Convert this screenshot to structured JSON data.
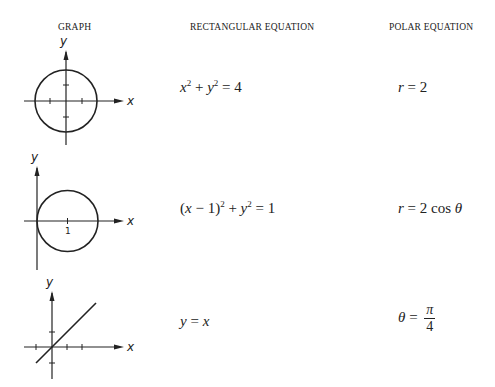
{
  "headers": {
    "graph": "GRAPH",
    "rectangular": "RECTANGULAR EQUATION",
    "polar": "POLAR EQUATION"
  },
  "rows": [
    {
      "graph": {
        "type": "circle-centered-origin",
        "x_label": "x",
        "y_label": "y"
      },
      "rectangular": {
        "text": "x² + y² = 4"
      },
      "polar": {
        "text": "r = 2"
      }
    },
    {
      "graph": {
        "type": "circle-centered-(1,0)",
        "x_label": "x",
        "y_label": "y",
        "tick_label": "1"
      },
      "rectangular": {
        "text": "(x − 1)² + y² = 1"
      },
      "polar": {
        "text": "r = 2 cos θ"
      }
    },
    {
      "graph": {
        "type": "line-y-equals-x",
        "x_label": "x",
        "y_label": "y"
      },
      "rectangular": {
        "text": "y = x"
      },
      "polar": {
        "text": "θ = π/4",
        "numerator": "π",
        "denominator": "4"
      }
    }
  ],
  "labels": {
    "x": "x",
    "y": "y",
    "one": "1",
    "eq": "=",
    "plus": "+",
    "minus": "−",
    "two": "2",
    "four": "4",
    "cos": "cos",
    "theta": "θ",
    "pi": "π",
    "r": "r"
  }
}
